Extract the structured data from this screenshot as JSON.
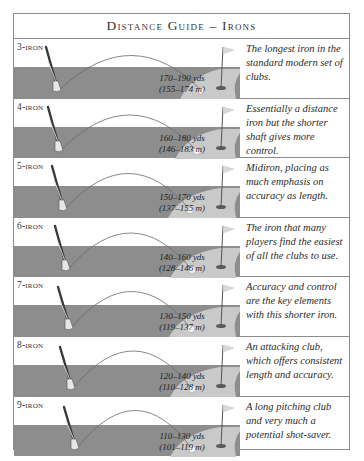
{
  "title": "Distance Guide – Irons",
  "colors": {
    "fairway": "#8d8d8d",
    "green": "#c9c9c9",
    "border": "#8c8c8c",
    "text": "#2a2a2a"
  },
  "irons": [
    {
      "club": "3-iron",
      "yards": "170–190 yds",
      "meters": "(155–174 m)",
      "description": "The longest iron in the standard modern set of clubs."
    },
    {
      "club": "4-iron",
      "yards": "160–180 yds",
      "meters": "(146–183 m)",
      "description": "Essentially a distance iron but the shorter shaft gives more control."
    },
    {
      "club": "5-iron",
      "yards": "150–170 yds",
      "meters": "(137–155 m)",
      "description": "Midiron, placing as much emphasis on accuracy as length."
    },
    {
      "club": "6-iron",
      "yards": "140–160 yds",
      "meters": "(128–146 m)",
      "description": "The iron that many players find the easiest of all the clubs to use."
    },
    {
      "club": "7-iron",
      "yards": "130–150 yds",
      "meters": "(119–137 m)",
      "description": "Accuracy and control are the key elements with this shorter iron."
    },
    {
      "club": "8-iron",
      "yards": "120–140 yds",
      "meters": "(110–128 m)",
      "description": "An attacking club, which offers consistent length and accuracy."
    },
    {
      "club": "9-iron",
      "yards": "110–130 yds",
      "meters": "(101–119 m)",
      "description": "A long pitching club and very much a potential shot-saver."
    }
  ],
  "icons": [
    "golf-club-icon",
    "ball-flight-arc",
    "golf-ball-icon",
    "flag-pin-icon",
    "hole-icon"
  ]
}
